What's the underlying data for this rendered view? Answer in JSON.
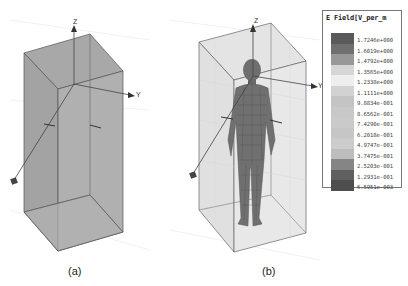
{
  "figure": {
    "panels": [
      {
        "id": "a",
        "caption": "(a)",
        "content": "empty computational box with coordinate axes"
      },
      {
        "id": "b",
        "caption": "(b)",
        "content": "human body mesh inside computational box with coordinate axes"
      }
    ],
    "axes_labels": {
      "z": "Z",
      "y": "Y"
    }
  },
  "legend": {
    "title": "E Field[V_per_m",
    "entries": [
      {
        "value": "1.7246e+000",
        "color": "#5a5a5a"
      },
      {
        "value": "1.6019e+000",
        "color": "#707070"
      },
      {
        "value": "1.4792e+000",
        "color": "#989898"
      },
      {
        "value": "1.3565e+000",
        "color": "#d6d6d6"
      },
      {
        "value": "1.2338e+000",
        "color": "#eeeeee"
      },
      {
        "value": "1.1111e+000",
        "color": "#d2d2d2"
      },
      {
        "value": "9.8834e-001",
        "color": "#c4c4c4"
      },
      {
        "value": "8.6562e-001",
        "color": "#c8c8c8"
      },
      {
        "value": "7.4290e-001",
        "color": "#cacaca"
      },
      {
        "value": "6.2018e-001",
        "color": "#c6c6c6"
      },
      {
        "value": "4.9747e-001",
        "color": "#cccccc"
      },
      {
        "value": "3.7475e-001",
        "color": "#bdbdbd"
      },
      {
        "value": "2.5203e-001",
        "color": "#858585"
      },
      {
        "value": "1.2931e-001",
        "color": "#606060"
      },
      {
        "value": "6.5951e-003",
        "color": "#4e4e4e"
      }
    ]
  }
}
